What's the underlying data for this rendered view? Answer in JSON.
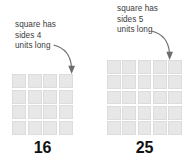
{
  "figure": {
    "background_color": "#ffffff",
    "cell_color": "#e7e7e7",
    "gridline_color": "#ffffff",
    "text_color": "#3b3b3b",
    "number_color": "#111111",
    "arrow_color": "#6d6d6d"
  },
  "left": {
    "annotation": {
      "line1": "square has",
      "line2": "sides 4",
      "line3": "units long"
    },
    "grid": {
      "columns": 4,
      "rows": 5,
      "cell_count": 16
    },
    "area_label": "16"
  },
  "right": {
    "annotation": {
      "line1": "square has",
      "line2": "sides 5",
      "line3": "units long"
    },
    "grid": {
      "columns": 5,
      "rows": 5,
      "cell_count": 25
    },
    "area_label": "25"
  }
}
